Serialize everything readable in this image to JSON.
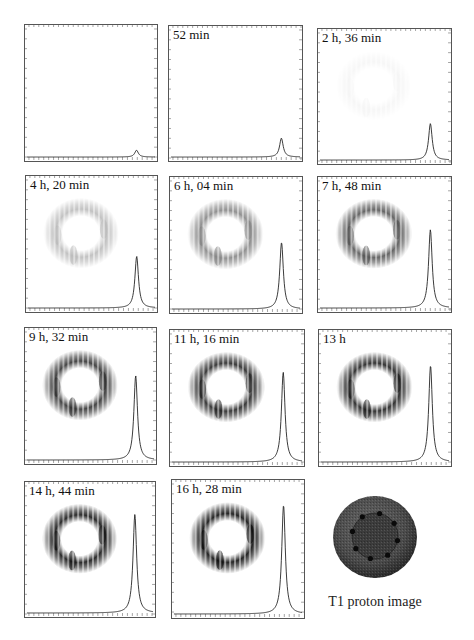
{
  "figure": {
    "panels": [
      {
        "label": "",
        "left": 24,
        "top": 24,
        "width": 134,
        "height": 138,
        "peak_height": 0.05,
        "ring_intensity": 0.0
      },
      {
        "label": "52 min",
        "left": 168,
        "top": 25,
        "width": 135,
        "height": 137,
        "peak_height": 0.14,
        "ring_intensity": 0.0
      },
      {
        "label": "2 h, 36 min",
        "left": 317,
        "top": 28,
        "width": 135,
        "height": 137,
        "peak_height": 0.27,
        "ring_intensity": 0.04
      },
      {
        "label": "4 h, 20 min",
        "left": 25,
        "top": 175,
        "width": 133,
        "height": 138,
        "peak_height": 0.38,
        "ring_intensity": 0.28
      },
      {
        "label": "6 h, 04 min",
        "left": 169,
        "top": 176,
        "width": 134,
        "height": 138,
        "peak_height": 0.49,
        "ring_intensity": 0.5
      },
      {
        "label": "7 h, 48 min",
        "left": 317,
        "top": 176,
        "width": 135,
        "height": 137,
        "peak_height": 0.58,
        "ring_intensity": 0.7
      },
      {
        "label": "9 h, 32 min",
        "left": 24,
        "top": 327,
        "width": 133,
        "height": 138,
        "peak_height": 0.62,
        "ring_intensity": 0.85
      },
      {
        "label": "11 h, 16 min",
        "left": 169,
        "top": 329,
        "width": 136,
        "height": 138,
        "peak_height": 0.66,
        "ring_intensity": 0.9
      },
      {
        "label": "13 h",
        "left": 318,
        "top": 329,
        "width": 134,
        "height": 138,
        "peak_height": 0.71,
        "ring_intensity": 0.93
      },
      {
        "label": "14 h, 44 min",
        "left": 24,
        "top": 481,
        "width": 132,
        "height": 137,
        "peak_height": 0.73,
        "ring_intensity": 0.97
      },
      {
        "label": "16 h, 28 min",
        "left": 171,
        "top": 479,
        "width": 134,
        "height": 140,
        "peak_height": 0.79,
        "ring_intensity": 1.0
      }
    ],
    "reference_image": {
      "label": "T1 proton image",
      "center_x": 375,
      "center_y": 537,
      "outer_radius": 42,
      "inner_radius": 23
    }
  },
  "chart_data": {
    "type": "line",
    "title": "",
    "categories": [
      "0",
      "52 min",
      "2 h, 36 min",
      "4 h, 20 min",
      "6 h, 04 min",
      "7 h, 48 min",
      "9 h, 32 min",
      "11 h, 16 min",
      "13 h",
      "14 h, 44 min",
      "16 h, 28 min"
    ],
    "series": [
      {
        "name": "relative peak height (fraction of panel height)",
        "values": [
          0.05,
          0.14,
          0.27,
          0.38,
          0.49,
          0.58,
          0.62,
          0.66,
          0.71,
          0.73,
          0.79
        ]
      }
    ],
    "xlabel": "",
    "ylabel": "",
    "annotations": [
      "T1 proton image"
    ],
    "grid": false
  }
}
